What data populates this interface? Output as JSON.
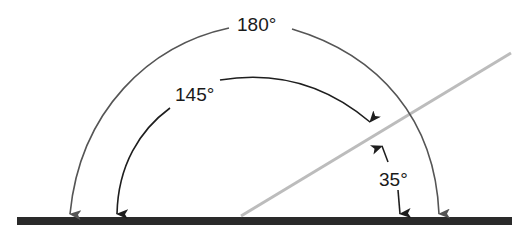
{
  "diagram": {
    "labels": {
      "angle_180": "180°",
      "angle_145": "145°",
      "angle_35": "35°"
    },
    "colors": {
      "baseline": "#2a2a2a",
      "ray": "#bcbcbc",
      "arc_180": "#555555",
      "arc_145": "#1e1e1e",
      "arrow_35": "#1e1e1e",
      "text": "#1a1a1a"
    },
    "angles": [
      {
        "name": "straight-angle",
        "degrees": 180
      },
      {
        "name": "obtuse-angle",
        "degrees": 145
      },
      {
        "name": "acute-angle",
        "degrees": 35
      }
    ]
  }
}
